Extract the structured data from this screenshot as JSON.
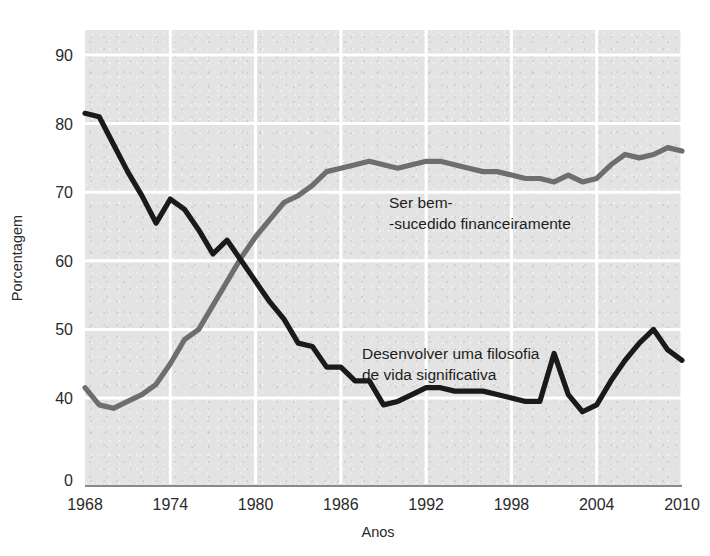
{
  "chart_data": {
    "type": "line",
    "title": "",
    "xlabel": "Anos",
    "ylabel": "Porcentagem",
    "grid": true,
    "legend_position": "inline-annotation",
    "axis_break": "Y axis is broken between 40 and 0",
    "xlim": [
      1968,
      2010
    ],
    "ylim": [
      40,
      90
    ],
    "xticks": [
      "1968",
      "1974",
      "1980",
      "1986",
      "1992",
      "1998",
      "2004",
      "2010"
    ],
    "yticks": [
      "90",
      "80",
      "70",
      "60",
      "50",
      "40",
      "0"
    ],
    "x": [
      1968,
      1969,
      1970,
      1971,
      1972,
      1973,
      1974,
      1975,
      1976,
      1977,
      1978,
      1979,
      1980,
      1981,
      1982,
      1983,
      1984,
      1985,
      1986,
      1987,
      1988,
      1989,
      1990,
      1991,
      1992,
      1993,
      1994,
      1995,
      1996,
      1997,
      1998,
      1999,
      2000,
      2001,
      2002,
      2003,
      2004,
      2005,
      2006,
      2007,
      2008,
      2009,
      2010
    ],
    "series": [
      {
        "name": "Ser bem-sucedido financeiramente",
        "color": "#6e6e6e",
        "label_line1": "Ser bem-",
        "label_line2": "-sucedido financeiramente",
        "values": [
          41.5,
          39.0,
          38.5,
          39.5,
          40.5,
          42.0,
          45.0,
          48.5,
          50.0,
          53.5,
          57.0,
          60.5,
          63.5,
          66.0,
          68.5,
          69.5,
          71.0,
          73.0,
          73.5,
          74.0,
          74.5,
          74.0,
          73.5,
          74.0,
          74.5,
          74.5,
          74.0,
          73.5,
          73.0,
          73.0,
          72.5,
          72.0,
          72.0,
          71.5,
          72.5,
          71.5,
          72.0,
          74.0,
          75.5,
          75.0,
          75.5,
          76.5,
          76.0
        ]
      },
      {
        "name": "Desenvolver uma filosofia de vida significativa",
        "color": "#1a1a1a",
        "label_line1": "Desenvolver uma filosofia",
        "label_line2": "de vida significativa",
        "values": [
          81.5,
          81.0,
          77.0,
          73.0,
          69.5,
          65.5,
          69.0,
          67.5,
          64.5,
          61.0,
          63.0,
          60.0,
          57.0,
          54.0,
          51.5,
          48.0,
          47.5,
          44.5,
          44.5,
          42.5,
          42.5,
          39.0,
          39.5,
          40.5,
          41.5,
          41.5,
          41.0,
          41.0,
          41.0,
          40.5,
          40.0,
          39.5,
          39.5,
          46.5,
          40.5,
          38.0,
          39.0,
          42.5,
          45.5,
          48.0,
          50.0,
          47.0,
          45.5
        ]
      }
    ]
  },
  "axis_labels": {
    "y_title": "Porcentagem",
    "x_title": "Anos"
  }
}
